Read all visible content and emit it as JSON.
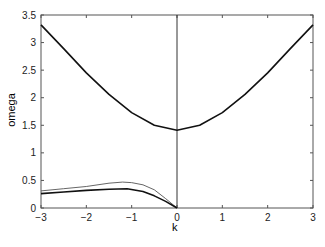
{
  "chart_data": {
    "type": "line",
    "title": "",
    "xlabel": "k",
    "ylabel": "omega",
    "xlim": [
      -3,
      3
    ],
    "ylim": [
      0,
      3.5
    ],
    "xticks": [
      "-3",
      "-2",
      "-1",
      "0",
      "1",
      "2",
      "3"
    ],
    "yticks": [
      "0",
      "0.5",
      "1",
      "1.5",
      "2",
      "2.5",
      "3",
      "3.5"
    ],
    "grid": false,
    "vline_x": 0,
    "series": [
      {
        "name": "upper branch",
        "style": "thick",
        "x": [
          -3,
          -2.5,
          -2,
          -1.5,
          -1,
          -0.5,
          0,
          0.5,
          1,
          1.5,
          2,
          2.5,
          3
        ],
        "y": [
          3.32,
          2.89,
          2.45,
          2.06,
          1.73,
          1.5,
          1.41,
          1.5,
          1.73,
          2.06,
          2.45,
          2.89,
          3.32
        ]
      },
      {
        "name": "lower branch (thin)",
        "style": "thin",
        "x": [
          -3,
          -2.5,
          -2,
          -1.5,
          -1.2,
          -1,
          -0.75,
          -0.5,
          -0.25,
          0
        ],
        "y": [
          0.31,
          0.35,
          0.39,
          0.45,
          0.47,
          0.46,
          0.42,
          0.33,
          0.17,
          0.0
        ]
      },
      {
        "name": "lower branch (thick)",
        "style": "thick",
        "x": [
          -3,
          -2.5,
          -2,
          -1.5,
          -1.1,
          -0.75,
          -0.5,
          -0.25,
          0
        ],
        "y": [
          0.26,
          0.29,
          0.32,
          0.34,
          0.35,
          0.3,
          0.22,
          0.12,
          0.0
        ]
      }
    ]
  }
}
